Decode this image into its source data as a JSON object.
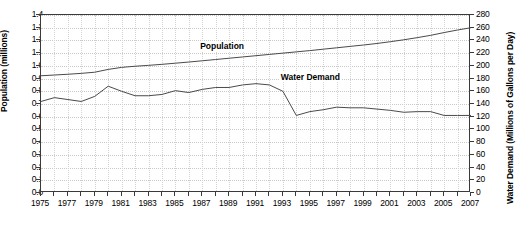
{
  "chart_data": {
    "type": "line",
    "title": "",
    "xlabel": "",
    "ylabel": "Population (millions)",
    "y2label": "Water Demand (Millions of Gallons per Day)",
    "grid": true,
    "legend_position": "inline-annotation",
    "xlim": [
      1975,
      2007
    ],
    "ylim": [
      0.0,
      1.4
    ],
    "y2lim": [
      0,
      280
    ],
    "ytick_step": 0.1,
    "y2tick_step": 20,
    "xtick_step": 1,
    "xlabel_step": 2,
    "x": [
      1975,
      1976,
      1977,
      1978,
      1979,
      1980,
      1981,
      1982,
      1983,
      1984,
      1985,
      1986,
      1987,
      1988,
      1989,
      1990,
      1991,
      1992,
      1993,
      1994,
      1995,
      1996,
      1997,
      1998,
      1999,
      2000,
      2001,
      2002,
      2003,
      2004,
      2005,
      2006,
      2007
    ],
    "xtick_labels": [
      "1975",
      "1977",
      "1979",
      "1981",
      "1983",
      "1985",
      "1987",
      "1989",
      "1991",
      "1993",
      "1995",
      "1997",
      "1999",
      "2001",
      "2003",
      "2005",
      "2007"
    ],
    "ytick_labels": [
      "0.0",
      "0.1",
      "0.2",
      "0.3",
      "0.4",
      "0.5",
      "0.6",
      "0.7",
      "0.8",
      "0.9",
      "1.0",
      "1.1",
      "1.2",
      "1.3",
      "1.4"
    ],
    "y2tick_labels": [
      "0",
      "20",
      "40",
      "60",
      "80",
      "100",
      "120",
      "140",
      "160",
      "180",
      "200",
      "220",
      "240",
      "260",
      "280"
    ],
    "series": [
      {
        "name": "Population",
        "axis": "left",
        "units": "millions",
        "color": "#4a4a4a",
        "label_x": 1989,
        "label_y": 1.15,
        "values": [
          0.922,
          0.928,
          0.934,
          0.941,
          0.95,
          0.972,
          0.988,
          0.997,
          1.004,
          1.012,
          1.021,
          1.03,
          1.04,
          1.05,
          1.06,
          1.07,
          1.08,
          1.09,
          1.1,
          1.11,
          1.12,
          1.131,
          1.142,
          1.153,
          1.164,
          1.176,
          1.19,
          1.205,
          1.222,
          1.24,
          1.262,
          1.282,
          1.3
        ]
      },
      {
        "name": "Water Demand",
        "axis": "right",
        "units": "Millions of Gallons per Day",
        "color": "#4a4a4a",
        "label_x": 1995,
        "label_y": 171,
        "values": [
          144,
          150,
          147,
          144,
          152,
          168,
          160,
          153,
          153,
          155,
          161,
          158,
          163,
          166,
          166,
          170,
          172,
          170,
          160,
          122,
          128,
          131,
          135,
          134,
          134,
          132,
          130,
          127,
          128,
          128,
          122,
          122,
          122
        ]
      }
    ]
  },
  "axes": {
    "left_title": "Population (millions)",
    "right_title": "Water Demand (Millions of Gallons per Day)"
  },
  "annotations": {
    "population_label": "Population",
    "water_demand_label": "Water Demand"
  }
}
